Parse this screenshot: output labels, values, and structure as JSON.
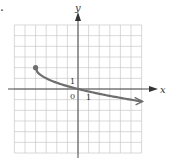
{
  "marker": ".",
  "chart_data": {
    "type": "line",
    "title": "",
    "xlabel": "x",
    "ylabel": "y",
    "xlim": [
      -6,
      6
    ],
    "ylim": [
      -6,
      6
    ],
    "grid": true,
    "tick_labels": {
      "origin": "0",
      "x_unit": "1",
      "y_unit": "1"
    },
    "series": [
      {
        "name": "y = 2 - sqrt(x + 4)",
        "start_point": {
          "x": -4,
          "y": 2,
          "closed": true
        },
        "end_arrow": true,
        "x": [
          -4,
          -3.5,
          -3,
          -2,
          -1,
          0,
          1,
          2,
          3,
          4,
          5,
          6
        ],
        "y": [
          2,
          1.29,
          1,
          0.59,
          0.27,
          0,
          -0.24,
          -0.45,
          -0.65,
          -0.83,
          -1,
          -1.16
        ],
        "color": "#6e6e6e"
      }
    ]
  },
  "colors": {
    "grid": "#c8c8c8",
    "axis": "#333333",
    "curve": "#6e6e6e"
  }
}
